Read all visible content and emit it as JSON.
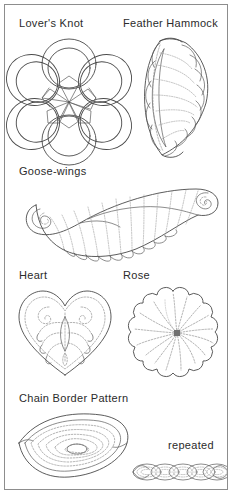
{
  "page": {
    "kind": "quilting-pattern-reference-sheet",
    "background_color": "#ffffff",
    "frame_color": "#8d8d8d",
    "line_color": "#4a4a4a",
    "stitch_line_color": "#8a8a8a",
    "text_color": "#2b2b2b"
  },
  "patterns": [
    {
      "id": "lovers-knot",
      "label": "Lover's Knot",
      "shape": "interlaced six-loop celtic knot with star center"
    },
    {
      "id": "feather-hammock",
      "label": "Feather Hammock",
      "shape": "crescent of scalloped feather plumes on a curved spine"
    },
    {
      "id": "goose-wings",
      "label": "Goose-wings",
      "shape": "pair of mirrored wings with spiral scroll ends and scalloped plumes"
    },
    {
      "id": "heart",
      "label": "Heart",
      "shape": "heart outline with inner echo line and symmetric scroll feathers"
    },
    {
      "id": "rose",
      "label": "Rose",
      "shape": "scalloped round rosette with radiating petal lines to an off-center eye"
    },
    {
      "id": "chain-border-pattern",
      "label": "Chain Border Pattern",
      "shape": "pointed lens with concentric nested lines spiralling to a small center oval"
    },
    {
      "id": "chain-border-repeated",
      "label": "repeated",
      "shape": "row of five overlapping lens links forming a continuous chain"
    }
  ]
}
